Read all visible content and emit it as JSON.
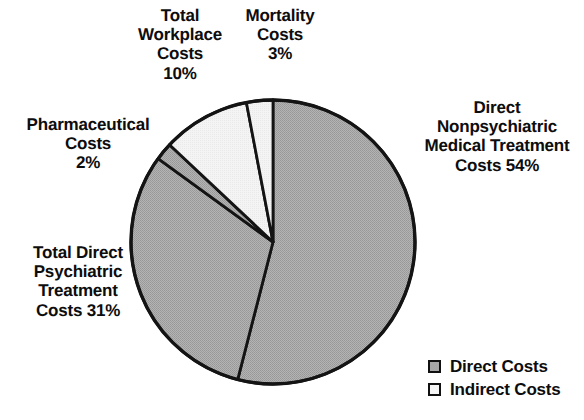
{
  "background_color": "#ffffff",
  "chart_data": {
    "type": "pie",
    "title": "",
    "start_angle_deg": 0,
    "direction": "clockwise",
    "legend_position": "bottom-right",
    "grid": false,
    "categories": [
      "Direct Nonpsychiatric Medical Treatment Costs",
      "Total Direct Psychiatric Treatment Costs",
      "Pharmaceutical Costs",
      "Total Workplace Costs",
      "Mortality Costs"
    ],
    "values": [
      54,
      31,
      2,
      10,
      3
    ],
    "unit": "%",
    "slices": [
      {
        "key": "nonpsychiatric",
        "name": "Direct Nonpsychiatric Medical Treatment Costs",
        "value": 54,
        "percent_text": "54%",
        "group": "Direct Costs",
        "color": "#a8a8a8",
        "start_deg": 0,
        "end_deg": 194.4
      },
      {
        "key": "psychiatric",
        "name": "Total Direct Psychiatric Treatment Costs",
        "value": 31,
        "percent_text": "31%",
        "group": "Direct Costs",
        "color": "#a8a8a8",
        "start_deg": 194.4,
        "end_deg": 306.0
      },
      {
        "key": "pharmaceutical",
        "name": "Pharmaceutical Costs",
        "value": 2,
        "percent_text": "2%",
        "group": "Direct Costs",
        "color": "#a8a8a8",
        "start_deg": 306.0,
        "end_deg": 313.2
      },
      {
        "key": "workplace",
        "name": "Total Workplace Costs",
        "value": 10,
        "percent_text": "10%",
        "group": "Indirect Costs",
        "color": "#f0f0f0",
        "start_deg": 313.2,
        "end_deg": 349.2
      },
      {
        "key": "mortality",
        "name": "Mortality Costs",
        "value": 3,
        "percent_text": "3%",
        "group": "Indirect Costs",
        "color": "#f0f0f0",
        "start_deg": 349.2,
        "end_deg": 360.0
      }
    ],
    "legend": [
      {
        "label": "Direct Costs",
        "color": "#a8a8a8"
      },
      {
        "label": "Indirect Costs",
        "color": "#f6f6f6"
      }
    ]
  },
  "labels": {
    "workplace": "Total\nWorkplace\nCosts\n10%",
    "mortality": "Mortality\nCosts\n3%",
    "pharmaceutical": "Pharmaceutical\nCosts\n2%",
    "psychiatric": "Total Direct\nPsychiatric\nTreatment\nCosts 31%",
    "nonpsychiatric": "Direct\nNonpsychiatric\nMedical Treatment\nCosts 54%"
  },
  "legend": {
    "direct": "Direct Costs",
    "indirect": "Indirect Costs"
  },
  "geometry": {
    "center_x": 273,
    "center_y": 242,
    "radius": 142,
    "outline_color": "#141414",
    "outline_width": 3.4,
    "divider_width": 2.8
  }
}
